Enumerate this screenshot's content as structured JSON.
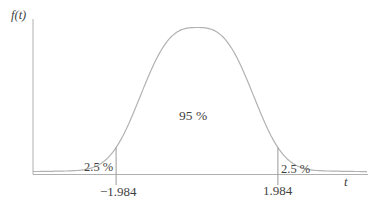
{
  "figure": {
    "y_axis_label": "f(t)",
    "x_axis_label": "t",
    "center_region_label": "95 %",
    "left_tail_label": "2.5 %",
    "right_tail_label": "2.5 %",
    "left_critical_label": "−1.984",
    "right_critical_label": "1.984"
  },
  "chart_data": {
    "type": "line",
    "title": "",
    "xlabel": "t",
    "ylabel": "f(t)",
    "curve": "bell-shaped probability density (t-distribution)",
    "critical_values": [
      -1.984,
      1.984
    ],
    "x_tick_labels": [
      "−1.984",
      "1.984"
    ],
    "regions": [
      {
        "range": "t < -1.984",
        "area": "2.5 %"
      },
      {
        "range": "-1.984 to 1.984",
        "area": "95 %"
      },
      {
        "range": "t > 1.984",
        "area": "2.5 %"
      }
    ],
    "grid": false,
    "legend": false,
    "colors": {
      "curve": "#b2b2b2",
      "axis": "#b0b0b0",
      "marker_line": "#9a9a9a",
      "text": "#3f3f3f"
    }
  }
}
